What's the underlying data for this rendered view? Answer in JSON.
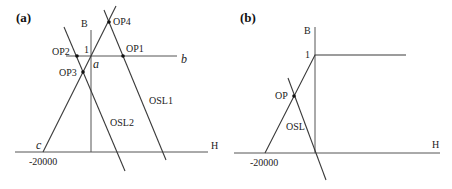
{
  "panel_a": {
    "label": "(a)",
    "axis_b": "B",
    "axis_h": "H",
    "tick_one": "1",
    "tick_h": "-20000",
    "point_a": "a",
    "point_b": "b",
    "point_c": "c",
    "op1": "OP1",
    "op2": "OP2",
    "op3": "OP3",
    "op4": "OP4",
    "osl1": "OSL1",
    "osl2": "OSL2"
  },
  "panel_b": {
    "label": "(b)",
    "axis_b": "B",
    "axis_h": "H",
    "tick_one": "1",
    "tick_h": "-20000",
    "op": "OP",
    "osl": "OSL"
  }
}
